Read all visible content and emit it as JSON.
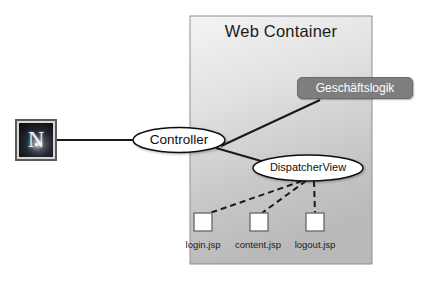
{
  "diagram": {
    "panel": {
      "label": "Web Container",
      "x": 190,
      "y": 16,
      "width": 182,
      "height": 248,
      "fill_top": "#f2f2f2",
      "fill_bottom": "#bdbdbd",
      "border_color": "#8a8a8a"
    },
    "client": {
      "glyph": "N",
      "icon_name": "netscape-browser-icon",
      "x": 15,
      "y": 119,
      "size": 42
    },
    "nodes": [
      {
        "id": "controller",
        "label": "Controller",
        "shape": "ellipse",
        "cx": 179,
        "cy": 140,
        "rx": 46,
        "ry": 12.5,
        "fill": "#ffffff",
        "stroke": "#111111",
        "text_color": "#111111"
      },
      {
        "id": "dispatcher-view",
        "label": "DispatcherView",
        "shape": "ellipse",
        "cx": 308,
        "cy": 168,
        "rx": 55,
        "ry": 13,
        "fill": "#ffffff",
        "stroke": "#111111",
        "text_color": "#111111"
      },
      {
        "id": "business-logic",
        "label": "Geschäftslogik",
        "shape": "rounded-rect",
        "x": 297,
        "y": 77,
        "width": 116,
        "height": 22,
        "fill": "#7e7e7e",
        "stroke": "#6a6a6a",
        "text_color": "#ffffff"
      }
    ],
    "pages": [
      {
        "id": "login",
        "label": "login.jsp",
        "x": 194,
        "y": 213,
        "size": 18
      },
      {
        "id": "content",
        "label": "content.jsp",
        "x": 250,
        "y": 213,
        "size": 18
      },
      {
        "id": "logout",
        "label": "logout.jsp",
        "x": 306,
        "y": 213,
        "size": 18
      }
    ],
    "edges": [
      {
        "id": "client-to-controller",
        "from": "client",
        "to": "controller",
        "style": "solid",
        "color": "#1a1a1a"
      },
      {
        "id": "controller-to-business-logic",
        "from": "controller",
        "to": "business-logic",
        "style": "solid",
        "color": "#1a1a1a"
      },
      {
        "id": "controller-to-dispatcher-view",
        "from": "controller",
        "to": "dispatcher-view",
        "style": "solid",
        "color": "#1a1a1a"
      },
      {
        "id": "dispatcher-view-to-login",
        "from": "dispatcher-view",
        "to": "login",
        "style": "dashed",
        "color": "#1a1a1a"
      },
      {
        "id": "dispatcher-view-to-content",
        "from": "dispatcher-view",
        "to": "content",
        "style": "dashed",
        "color": "#1a1a1a"
      },
      {
        "id": "dispatcher-view-to-logout",
        "from": "dispatcher-view",
        "to": "logout",
        "style": "dashed",
        "color": "#1a1a1a"
      }
    ],
    "colors": {
      "background": "#ffffff",
      "page_fill": "#ffffff",
      "page_stroke": "#6e6e6e",
      "accent_gray": "#7e7e7e"
    }
  }
}
